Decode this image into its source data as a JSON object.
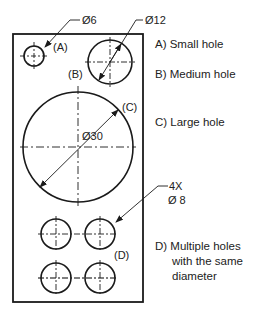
{
  "drawing": {
    "colors": {
      "stroke": "#1a1a1a",
      "text": "#222222",
      "background": "#ffffff"
    },
    "plate": {
      "x": 13,
      "y": 34,
      "width": 130,
      "height": 268
    },
    "holes": {
      "A": {
        "tag": "(A)",
        "dimension": "Ø6",
        "cx": 34,
        "cy": 56,
        "r": 10
      },
      "B": {
        "tag": "(B)",
        "dimension": "Ø12",
        "cx": 110,
        "cy": 62,
        "r": 22
      },
      "C": {
        "tag": "(C)",
        "dimension": "Ø30",
        "cx": 78,
        "cy": 147,
        "r": 55
      },
      "D": {
        "tag": "(D)",
        "count": "4X",
        "dimension": "Ø 8",
        "r": 15,
        "centers": [
          [
            56,
            234
          ],
          [
            100,
            234
          ],
          [
            56,
            278
          ],
          [
            100,
            278
          ]
        ]
      }
    }
  },
  "legend": {
    "a": "A) Small hole",
    "b": "B) Medium hole",
    "c": "C) Large hole",
    "d_line1": "D) Multiple holes",
    "d_line2": "with the same",
    "d_line3": "diameter"
  }
}
